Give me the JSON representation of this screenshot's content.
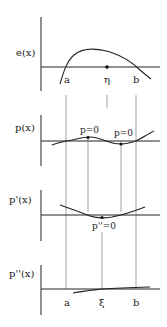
{
  "panels": [
    {
      "id": "e",
      "label": "e(x)",
      "points": [
        {
          "name": "a",
          "label": "a"
        },
        {
          "name": "eta",
          "label": "η"
        },
        {
          "name": "b",
          "label": "b"
        }
      ]
    },
    {
      "id": "p",
      "label": "p(x)",
      "annotations": [
        "p=0",
        "p=0"
      ]
    },
    {
      "id": "p1",
      "label": "p'(x)",
      "annotations": [
        "p''=0"
      ]
    },
    {
      "id": "p2",
      "label": "p''(x)",
      "points": [
        {
          "name": "a",
          "label": "a"
        },
        {
          "name": "xi",
          "label": "ξ"
        },
        {
          "name": "b",
          "label": "b"
        }
      ]
    }
  ],
  "colors": {
    "line": "#222222",
    "guide": "#666666",
    "background": "#ffffff"
  }
}
